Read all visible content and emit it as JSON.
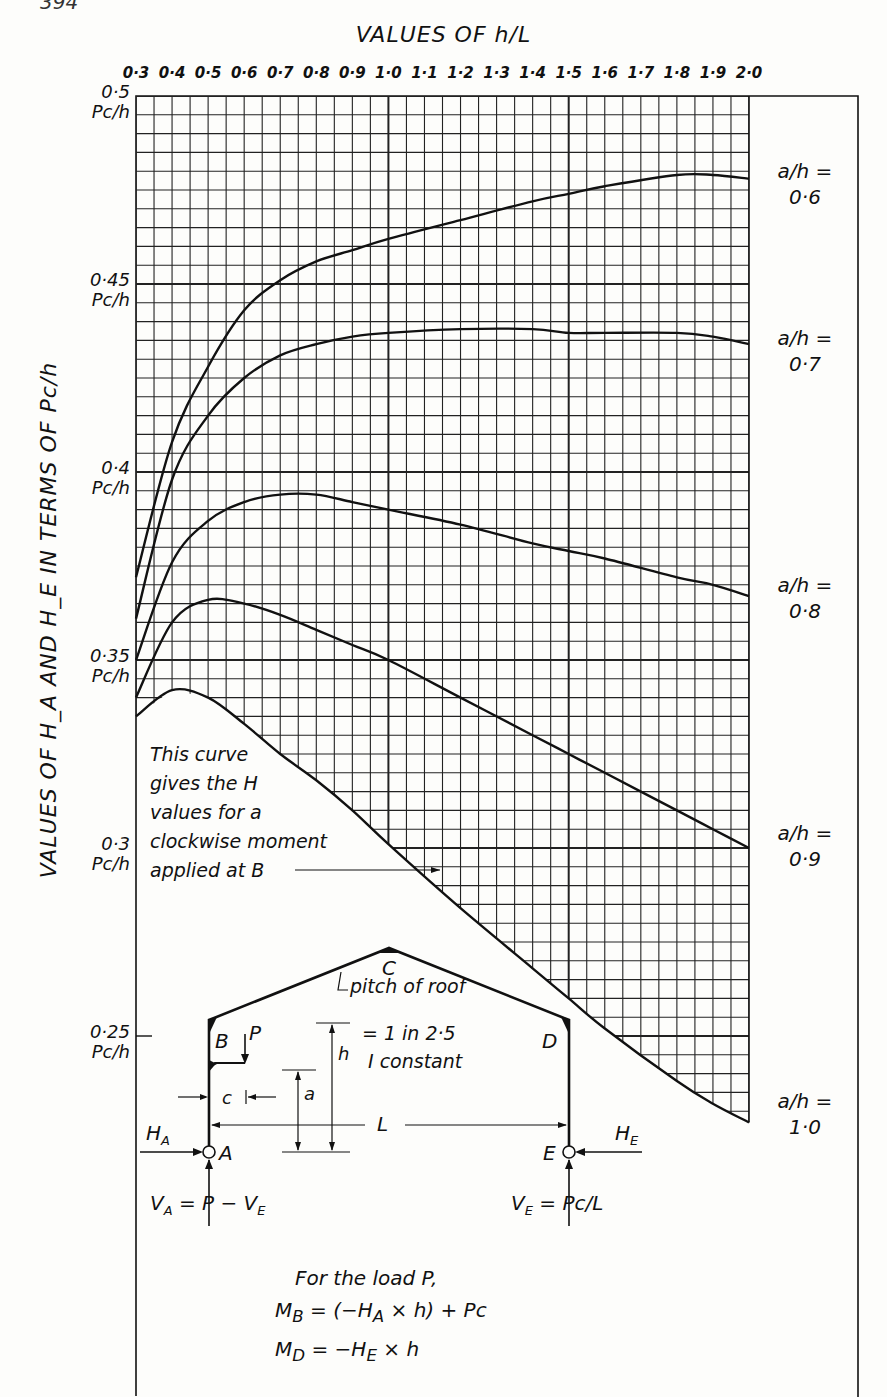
{
  "page": {
    "number": "394"
  },
  "chart_data": {
    "type": "line",
    "title": "VALUES OF h/L",
    "xlabel": "VALUES OF h/L",
    "ylabel": "VALUES OF H_A AND H_E IN TERMS OF Pc/h",
    "x_ticks": [
      "0·3",
      "0·4",
      "0·5",
      "0·6",
      "0·7",
      "0·8",
      "0·9",
      "1·0",
      "1·1",
      "1·2",
      "1·3",
      "1·4",
      "1·5",
      "1·6",
      "1·7",
      "1·8",
      "1·9",
      "2·0"
    ],
    "x_tick_values": [
      0.3,
      0.4,
      0.5,
      0.6,
      0.7,
      0.8,
      0.9,
      1.0,
      1.1,
      1.2,
      1.3,
      1.4,
      1.5,
      1.6,
      1.7,
      1.8,
      1.9,
      2.0
    ],
    "y_ticks": [
      {
        "value": 0.5,
        "label": "0·5",
        "unit": "Pc/h"
      },
      {
        "value": 0.45,
        "label": "0·45",
        "unit": "Pc/h"
      },
      {
        "value": 0.4,
        "label": "0·4",
        "unit": "Pc/h"
      },
      {
        "value": 0.35,
        "label": "0·35",
        "unit": "Pc/h"
      },
      {
        "value": 0.3,
        "label": "0·3",
        "unit": "Pc/h"
      },
      {
        "value": 0.25,
        "label": "0·25",
        "unit": "Pc/h"
      }
    ],
    "xlim": [
      0.3,
      2.0
    ],
    "ylim": [
      0.25,
      0.5
    ],
    "grid": true,
    "grid_minor_x": 0.05,
    "grid_minor_y": 0.005,
    "legend_position": "right (inline labels at curve ends)",
    "x": [
      0.3,
      0.4,
      0.5,
      0.6,
      0.7,
      0.8,
      0.9,
      1.0,
      1.2,
      1.4,
      1.5,
      1.6,
      1.8,
      1.9,
      2.0
    ],
    "series": [
      {
        "name": "a/h = 0·6",
        "label_line1": "a/h =",
        "label_line2": "0·6",
        "values": [
          0.372,
          0.408,
          0.428,
          0.443,
          0.451,
          0.456,
          0.459,
          0.462,
          0.467,
          0.472,
          0.474,
          0.476,
          0.479,
          0.479,
          0.478
        ]
      },
      {
        "name": "a/h = 0·7",
        "label_line1": "a/h =",
        "label_line2": "0·7",
        "values": [
          0.361,
          0.398,
          0.415,
          0.425,
          0.431,
          0.434,
          0.436,
          0.437,
          0.438,
          0.438,
          0.437,
          0.437,
          0.437,
          0.436,
          0.434
        ]
      },
      {
        "name": "a/h = 0·8",
        "label_line1": "a/h =",
        "label_line2": "0·8",
        "values": [
          0.35,
          0.376,
          0.387,
          0.392,
          0.394,
          0.394,
          0.392,
          0.39,
          0.386,
          0.381,
          0.379,
          0.377,
          0.372,
          0.37,
          0.367
        ]
      },
      {
        "name": "a/h = 0·9",
        "label_line1": "a/h =",
        "label_line2": "0·9",
        "values": [
          0.34,
          0.36,
          0.366,
          0.365,
          0.362,
          0.358,
          0.354,
          0.35,
          0.34,
          0.33,
          0.325,
          0.32,
          0.31,
          0.305,
          0.3
        ]
      },
      {
        "name": "a/h = 1·0",
        "label_line1": "a/h =",
        "label_line2": "1·0",
        "values": [
          0.335,
          0.342,
          0.34,
          0.333,
          0.325,
          0.318,
          0.31,
          0.301,
          0.284,
          0.268,
          0.26,
          0.252,
          0.238,
          0.232,
          0.227
        ]
      }
    ],
    "annotations": [
      "This curve gives the H values for a clockwise moment applied at B"
    ]
  },
  "axis": {
    "top_title": "VALUES OF h/L",
    "y_title": "VALUES OF H_A AND H_E IN TERMS OF Pc/h"
  },
  "note": {
    "lines": [
      "This curve",
      "gives the H",
      "values for a",
      "clockwise moment",
      "applied at B"
    ]
  },
  "frame": {
    "labels": {
      "A": "A",
      "B": "B",
      "C": "C",
      "D": "D",
      "E": "E",
      "P": "P",
      "c": "c",
      "a": "a",
      "h": "h",
      "L": "L",
      "HA": "H",
      "HA_sub": "A",
      "HE": "H",
      "HE_sub": "E"
    },
    "pitch_line1": "pitch of roof",
    "pitch_line2": "= 1 in 2·5",
    "pitch_line3": "I constant",
    "VA": "V",
    "VA_sub": "A",
    "VA_expr": "= P − V",
    "VA_expr_sub": "E",
    "VE": "V",
    "VE_sub": "E",
    "VE_expr": "= Pc/L"
  },
  "formulas": {
    "intro": "For the load P,",
    "MB": "M",
    "MB_sub": "B",
    "MB_expr": " = (−H",
    "MB_expr_sub": "A",
    "MB_expr_tail": " × h) + Pc",
    "MD": "M",
    "MD_sub": "D",
    "MD_expr": " = −H",
    "MD_expr_sub": "E",
    "MD_expr_tail": " × h"
  },
  "colors": {
    "ink": "#111111",
    "paper": "#fdfdfb",
    "grid": "#222222"
  }
}
